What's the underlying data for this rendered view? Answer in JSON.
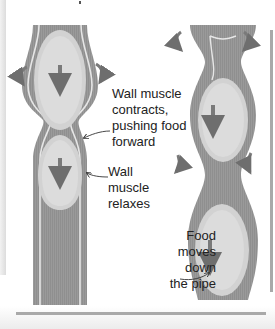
{
  "diagram": {
    "labels": {
      "contracts": "Wall muscle\ncontracts,\npushing food\nforward",
      "relaxes": "Wall\nmuscle\nrelaxes",
      "food_moves": "Food\nmoves\ndown\nthe pipe"
    },
    "colors": {
      "wall_dark": "#8c8c8c",
      "wall_mid": "#a6a6a6",
      "lining_light": "#e0e0e0",
      "food_bolus": "#cfcfcf",
      "arrow": "#7a7a7a",
      "text": "#222222",
      "background": "#ffffff"
    },
    "tubes": [
      {
        "name": "left-esophagus-segment",
        "boluses": 2
      },
      {
        "name": "right-esophagus-segment",
        "boluses": 3
      }
    ]
  }
}
